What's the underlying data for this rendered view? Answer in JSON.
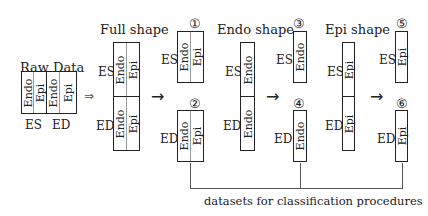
{
  "raw_data": {
    "title": "Raw Data",
    "cells": [
      "Endo",
      "Epi",
      "Endo",
      "Epi"
    ],
    "bottom_labels": [
      "ES",
      "ED"
    ]
  },
  "implies_arrow": "⇒",
  "full_shape": {
    "title": "Full shape",
    "es_label": "ES",
    "ed_label": "ED",
    "cells": [
      "Endo",
      "Epi"
    ],
    "arrow": "→",
    "outputs": [
      {
        "marker": "①",
        "phase": "ES",
        "cells": [
          "Endo",
          "Epi"
        ]
      },
      {
        "marker": "②",
        "phase": "ED",
        "cells": [
          "Endo",
          "Epi"
        ]
      }
    ]
  },
  "endo_shape": {
    "title": "Endo shape",
    "es_label": "ES",
    "ed_label": "ED",
    "cell": "Endo",
    "arrow": "→",
    "outputs": [
      {
        "marker": "③",
        "phase": "ES",
        "cell": "Endo"
      },
      {
        "marker": "④",
        "phase": "ED",
        "cell": "Endo"
      }
    ]
  },
  "epi_shape": {
    "title": "Epi shape",
    "es_label": "ES",
    "ed_label": "ED",
    "cell": "Epi",
    "arrow": "→",
    "outputs": [
      {
        "marker": "⑤",
        "phase": "ES",
        "cell": "Epi"
      },
      {
        "marker": "⑥",
        "phase": "ED",
        "cell": "Epi"
      }
    ]
  },
  "bracket_caption": "datasets for classification procedures"
}
